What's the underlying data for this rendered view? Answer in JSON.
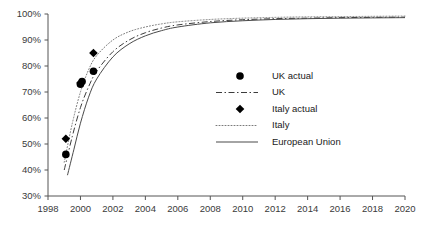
{
  "chart_data": {
    "type": "line",
    "title": "",
    "subtitle": "",
    "xlabel": "",
    "ylabel": "",
    "xlim": [
      1998,
      2020
    ],
    "ylim": [
      30,
      100
    ],
    "grid": false,
    "legend_position": "center-right",
    "x_ticks": [
      "1998",
      "2000",
      "2002",
      "2004",
      "2006",
      "2008",
      "2010",
      "2012",
      "2014",
      "2016",
      "2018",
      "2020"
    ],
    "x_tick_values": [
      1998,
      2000,
      2002,
      2004,
      2006,
      2008,
      2010,
      2012,
      2014,
      2016,
      2018,
      2020
    ],
    "y_ticks": [
      "30%",
      "40%",
      "50%",
      "60%",
      "70%",
      "80%",
      "90%",
      "100%"
    ],
    "y_tick_values": [
      30,
      40,
      50,
      60,
      70,
      80,
      90,
      100
    ],
    "series": [
      {
        "name": "UK actual",
        "style": "markers",
        "marker": "circle",
        "color": "#000000",
        "points": [
          {
            "x": 1999.1,
            "y": 46.0
          },
          {
            "x": 2000.0,
            "y": 73.0
          },
          {
            "x": 2000.1,
            "y": 74.0
          },
          {
            "x": 2000.8,
            "y": 78.0
          }
        ]
      },
      {
        "name": "UK",
        "style": "dash-dot",
        "color": "#3c3c3c",
        "values": [
          {
            "x": 1999.0,
            "y": 40.0
          },
          {
            "x": 1999.5,
            "y": 53.0
          },
          {
            "x": 2000.0,
            "y": 64.0
          },
          {
            "x": 2000.5,
            "y": 72.0
          },
          {
            "x": 2001.0,
            "y": 78.0
          },
          {
            "x": 2002.0,
            "y": 85.5
          },
          {
            "x": 2003.0,
            "y": 90.0
          },
          {
            "x": 2004.0,
            "y": 92.8
          },
          {
            "x": 2005.0,
            "y": 94.6
          },
          {
            "x": 2006.0,
            "y": 95.8
          },
          {
            "x": 2008.0,
            "y": 97.1
          },
          {
            "x": 2010.0,
            "y": 97.8
          },
          {
            "x": 2012.0,
            "y": 98.2
          },
          {
            "x": 2014.0,
            "y": 98.4
          },
          {
            "x": 2016.0,
            "y": 98.6
          },
          {
            "x": 2018.0,
            "y": 98.7
          },
          {
            "x": 2020.0,
            "y": 98.8
          }
        ]
      },
      {
        "name": "Italy actual",
        "style": "markers",
        "marker": "diamond",
        "color": "#000000",
        "points": [
          {
            "x": 1999.1,
            "y": 52.0
          },
          {
            "x": 2000.0,
            "y": 73.5
          },
          {
            "x": 2000.8,
            "y": 85.0
          }
        ]
      },
      {
        "name": "Italy",
        "style": "dotted",
        "color": "#7a7a7a",
        "values": [
          {
            "x": 1999.0,
            "y": 43.0
          },
          {
            "x": 1999.5,
            "y": 58.0
          },
          {
            "x": 2000.0,
            "y": 70.0
          },
          {
            "x": 2000.5,
            "y": 78.5
          },
          {
            "x": 2001.0,
            "y": 84.0
          },
          {
            "x": 2002.0,
            "y": 90.0
          },
          {
            "x": 2003.0,
            "y": 93.2
          },
          {
            "x": 2004.0,
            "y": 95.0
          },
          {
            "x": 2005.0,
            "y": 96.2
          },
          {
            "x": 2006.0,
            "y": 97.0
          },
          {
            "x": 2008.0,
            "y": 97.9
          },
          {
            "x": 2010.0,
            "y": 98.4
          },
          {
            "x": 2012.0,
            "y": 98.7
          },
          {
            "x": 2014.0,
            "y": 98.9
          },
          {
            "x": 2016.0,
            "y": 99.0
          },
          {
            "x": 2018.0,
            "y": 99.1
          },
          {
            "x": 2020.0,
            "y": 99.2
          }
        ]
      },
      {
        "name": "European Union",
        "style": "solid",
        "color": "#4a4a4a",
        "values": [
          {
            "x": 1999.2,
            "y": 38.0
          },
          {
            "x": 1999.6,
            "y": 48.0
          },
          {
            "x": 2000.0,
            "y": 58.0
          },
          {
            "x": 2000.5,
            "y": 68.0
          },
          {
            "x": 2001.0,
            "y": 75.0
          },
          {
            "x": 2002.0,
            "y": 83.5
          },
          {
            "x": 2003.0,
            "y": 88.5
          },
          {
            "x": 2004.0,
            "y": 91.6
          },
          {
            "x": 2005.0,
            "y": 93.6
          },
          {
            "x": 2006.0,
            "y": 95.0
          },
          {
            "x": 2008.0,
            "y": 96.6
          },
          {
            "x": 2010.0,
            "y": 97.4
          },
          {
            "x": 2012.0,
            "y": 97.9
          },
          {
            "x": 2014.0,
            "y": 98.2
          },
          {
            "x": 2016.0,
            "y": 98.4
          },
          {
            "x": 2018.0,
            "y": 98.5
          },
          {
            "x": 2020.0,
            "y": 98.6
          }
        ]
      }
    ]
  },
  "legend": {
    "items": [
      {
        "label": "UK actual",
        "kind": "marker-circle"
      },
      {
        "label": "UK",
        "kind": "line-dashdot"
      },
      {
        "label": "Italy actual",
        "kind": "marker-diamond"
      },
      {
        "label": "Italy",
        "kind": "line-dotted"
      },
      {
        "label": "European Union",
        "kind": "line-solid"
      }
    ]
  }
}
